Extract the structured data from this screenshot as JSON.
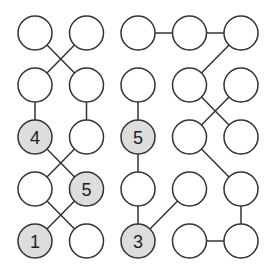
{
  "puzzle": {
    "grid": {
      "cols": 5,
      "rows": 5,
      "x0": 35,
      "y0": 33,
      "dx": 51.5,
      "dy": 52,
      "radius": 17
    },
    "colors": {
      "stroke": "#333333",
      "empty_fill": "#ffffff",
      "clue_fill": "#dddddd"
    },
    "clues": [
      {
        "col": 0,
        "row": 2,
        "value": "4"
      },
      {
        "col": 1,
        "row": 3,
        "value": "5"
      },
      {
        "col": 0,
        "row": 4,
        "value": "1"
      },
      {
        "col": 2,
        "row": 2,
        "value": "5"
      },
      {
        "col": 2,
        "row": 4,
        "value": "3"
      }
    ],
    "links": [
      [
        [
          0,
          0
        ],
        [
          1,
          1
        ]
      ],
      [
        [
          1,
          0
        ],
        [
          0,
          1
        ]
      ],
      [
        [
          0,
          1
        ],
        [
          0,
          2
        ]
      ],
      [
        [
          1,
          1
        ],
        [
          1,
          2
        ]
      ],
      [
        [
          0,
          2
        ],
        [
          1,
          3
        ]
      ],
      [
        [
          1,
          2
        ],
        [
          0,
          3
        ]
      ],
      [
        [
          0,
          3
        ],
        [
          1,
          4
        ]
      ],
      [
        [
          1,
          3
        ],
        [
          0,
          4
        ]
      ],
      [
        [
          2,
          0
        ],
        [
          3,
          0
        ]
      ],
      [
        [
          3,
          0
        ],
        [
          4,
          0
        ]
      ],
      [
        [
          4,
          0
        ],
        [
          3,
          1
        ]
      ],
      [
        [
          2,
          1
        ],
        [
          2,
          2
        ]
      ],
      [
        [
          2,
          2
        ],
        [
          2,
          3
        ]
      ],
      [
        [
          2,
          3
        ],
        [
          2,
          4
        ]
      ],
      [
        [
          3,
          1
        ],
        [
          4,
          2
        ]
      ],
      [
        [
          4,
          1
        ],
        [
          3,
          2
        ]
      ],
      [
        [
          3,
          2
        ],
        [
          4,
          3
        ]
      ],
      [
        [
          3,
          3
        ],
        [
          2,
          4
        ]
      ],
      [
        [
          4,
          3
        ],
        [
          4,
          4
        ]
      ],
      [
        [
          3,
          4
        ],
        [
          4,
          4
        ]
      ]
    ]
  }
}
